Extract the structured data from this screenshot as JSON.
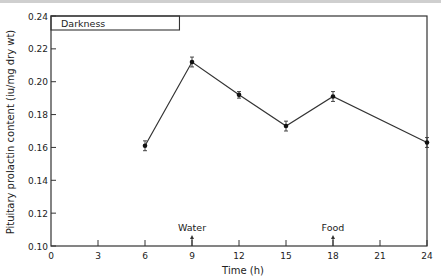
{
  "chart_data": {
    "type": "line",
    "title": "",
    "xlabel": "Time (h)",
    "ylabel": "Pituitary prolactin content (iu/mg dry wt)",
    "xlim": [
      0,
      24
    ],
    "ylim": [
      0.1,
      0.24
    ],
    "xticks": [
      0,
      3,
      6,
      9,
      12,
      15,
      18,
      21,
      24
    ],
    "xtick_labels": [
      "0",
      "3",
      "6",
      "9",
      "12",
      "15",
      "18",
      "21",
      "24"
    ],
    "yticks": [
      0.1,
      0.12,
      0.14,
      0.16,
      0.18,
      0.2,
      0.22,
      0.24
    ],
    "ytick_labels": [
      "0.10",
      "0.12",
      "0.14",
      "0.16",
      "0.18",
      "0.20",
      "0.22",
      "0.24"
    ],
    "grid": false,
    "series": [
      {
        "name": "Pituitary prolactin content",
        "x": [
          6,
          9,
          12,
          15,
          18,
          24
        ],
        "values": [
          0.161,
          0.212,
          0.192,
          0.173,
          0.191,
          0.163
        ],
        "error": [
          0.003,
          0.003,
          0.002,
          0.003,
          0.003,
          0.003
        ]
      }
    ],
    "annotations": [
      {
        "text": "Darkness",
        "type": "bar",
        "x_start": 0,
        "x_end": 8.2
      },
      {
        "text": "Water",
        "type": "arrow",
        "x": 9
      },
      {
        "text": "Food",
        "type": "arrow",
        "x": 18
      }
    ]
  }
}
